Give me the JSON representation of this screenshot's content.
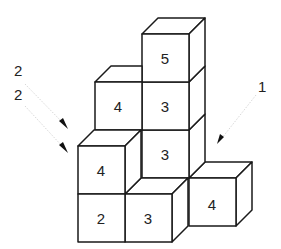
{
  "figure": {
    "cubes": [
      {
        "id": "top-5",
        "label": "5"
      },
      {
        "id": "col-mid-3a",
        "label": "3"
      },
      {
        "id": "col-mid-3b",
        "label": "3"
      },
      {
        "id": "left-back-4",
        "label": "4"
      },
      {
        "id": "front-left-4",
        "label": "4"
      },
      {
        "id": "front-left-2",
        "label": "2"
      },
      {
        "id": "front-bottom-3",
        "label": "3"
      },
      {
        "id": "right-4",
        "label": "4"
      }
    ],
    "annotations": [
      {
        "id": "arrow-label-left-top",
        "text": "2"
      },
      {
        "id": "arrow-label-left-bottom",
        "text": "2"
      },
      {
        "id": "arrow-label-right",
        "text": "1"
      }
    ],
    "colors": {
      "stroke": "#1a1a1a",
      "fill": "#ffffff",
      "guide": "#d8d8d8"
    }
  }
}
